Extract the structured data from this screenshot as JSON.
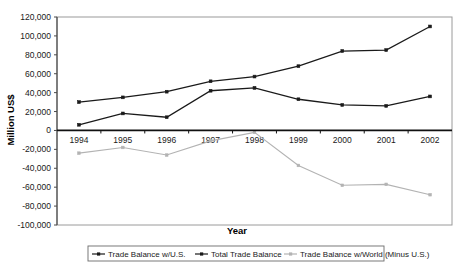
{
  "chart_data": {
    "type": "line",
    "title": "",
    "xlabel": "Year",
    "ylabel": "Million US$",
    "categories": [
      "1994",
      "1995",
      "1996",
      "1997",
      "1998",
      "1999",
      "2000",
      "2001",
      "2002"
    ],
    "ylim": [
      -100000,
      120000
    ],
    "ytick_step": 20000,
    "ytick_labels": [
      "120,000",
      "100,000",
      "80,000",
      "60,000",
      "40,000",
      "20,000",
      "0",
      "-20,000",
      "-40,000",
      "-60,000",
      "-80,000",
      "-100,000"
    ],
    "ytick_values": [
      120000,
      100000,
      80000,
      60000,
      40000,
      20000,
      0,
      -20000,
      -40000,
      -60000,
      -80000,
      -100000
    ],
    "grid": false,
    "legend_position": "bottom",
    "series": [
      {
        "name": "Trade Balance w/U.S.",
        "color": "#1a1a1a",
        "marker": "square",
        "values": [
          6000,
          18000,
          14000,
          42000,
          45000,
          33000,
          27000,
          26000,
          36000
        ]
      },
      {
        "name": "Total Trade Balance",
        "color": "#1a1a1a",
        "marker": "square",
        "values": [
          30000,
          35000,
          41000,
          52000,
          57000,
          68000,
          84000,
          85000,
          110000
        ]
      },
      {
        "name": "Trade Balance w/World (Minus U.S.)",
        "color": "#b3b3b3",
        "marker": "square",
        "values": [
          -24000,
          -18000,
          -26000,
          -11000,
          -2000,
          -37000,
          -58000,
          -57000,
          -68000
        ]
      }
    ]
  },
  "axis": {
    "y_title": "Million US$",
    "x_title": "Year"
  },
  "legend": {
    "entries": [
      {
        "label": "Trade Balance w/U.S.",
        "color": "#1a1a1a"
      },
      {
        "label": "Total Trade Balance",
        "color": "#1a1a1a"
      },
      {
        "label": "Trade Balance w/World (Minus U.S.)",
        "color": "#b3b3b3"
      }
    ]
  }
}
